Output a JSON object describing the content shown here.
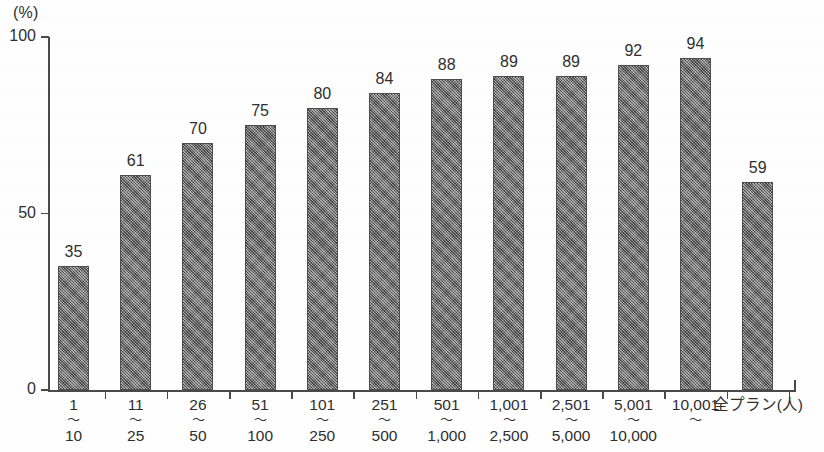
{
  "chart_data": {
    "type": "bar",
    "title": "",
    "subtitle": "",
    "unit_label": "(%)",
    "xlabel": "全プラン(人)",
    "ylabel": "",
    "ylim": [
      0,
      100
    ],
    "yticks": [
      0,
      50,
      100
    ],
    "ytick_labels": [
      "0",
      "50",
      "100"
    ],
    "grid": false,
    "legend": false,
    "categories": [
      "1〜10",
      "11〜25",
      "26〜50",
      "51〜100",
      "101〜250",
      "251〜500",
      "501〜1,000",
      "1,001〜2,500",
      "2,501〜5,000",
      "5,001〜10,000",
      "10,001〜",
      "全プラン"
    ],
    "values": [
      35,
      61,
      70,
      75,
      80,
      84,
      88,
      89,
      89,
      92,
      94,
      59
    ],
    "bar_color": "#6f6f6f",
    "axis_color": "#4a4a4a",
    "text_color": "#2f2f2f",
    "background_color": "#ffffff"
  },
  "axis": {
    "unit": "(%)",
    "y_tick_0": "0",
    "y_tick_50": "50",
    "y_tick_100": "100",
    "x_unit_suffix": "(人)"
  },
  "categories_detail": [
    {
      "from": "1",
      "tilde": "〜",
      "to": "10",
      "value_label": "35"
    },
    {
      "from": "11",
      "tilde": "〜",
      "to": "25",
      "value_label": "61"
    },
    {
      "from": "26",
      "tilde": "〜",
      "to": "50",
      "value_label": "70"
    },
    {
      "from": "51",
      "tilde": "〜",
      "to": "100",
      "value_label": "75"
    },
    {
      "from": "101",
      "tilde": "〜",
      "to": "250",
      "value_label": "80"
    },
    {
      "from": "251",
      "tilde": "〜",
      "to": "500",
      "value_label": "84"
    },
    {
      "from": "501",
      "tilde": "〜",
      "to": "1,000",
      "value_label": "88"
    },
    {
      "from": "1,001",
      "tilde": "〜",
      "to": "2,500",
      "value_label": "89"
    },
    {
      "from": "2,501",
      "tilde": "〜",
      "to": "5,000",
      "value_label": "89"
    },
    {
      "from": "5,001",
      "tilde": "〜",
      "to": "10,000",
      "value_label": "92"
    },
    {
      "from": "10,001",
      "tilde": "〜",
      "to": "",
      "value_label": "94"
    },
    {
      "from": "全プラン(人)",
      "tilde": "",
      "to": "",
      "value_label": "59"
    }
  ]
}
